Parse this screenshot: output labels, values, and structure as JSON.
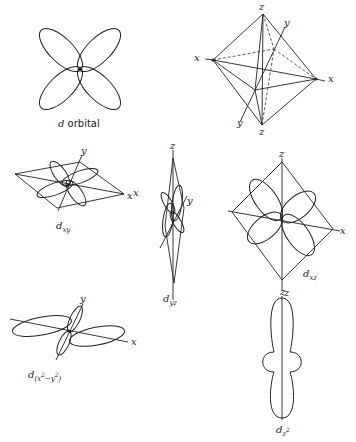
{
  "figure": {
    "panels": [
      {
        "id": "d-orbital",
        "caption_symbol": "d",
        "caption_text": " orbital"
      },
      {
        "id": "octahedron",
        "axis_labels": {
          "z_top": "z",
          "z_bottom": "z",
          "y_top": "y",
          "y_bottom": "y",
          "x_left": "x",
          "x_right": "x"
        }
      },
      {
        "id": "dxy",
        "caption_symbol": "d",
        "caption_sub": "xy",
        "axis_labels": {
          "y": "y",
          "x": "x"
        }
      },
      {
        "id": "dyz",
        "caption_symbol": "d",
        "caption_sub": "yz",
        "axis_labels": {
          "z": "z",
          "y": "y",
          "x": "x"
        }
      },
      {
        "id": "dxz",
        "caption_symbol": "d",
        "caption_sub": "xz",
        "axis_labels": {
          "z_top": "z",
          "z_bottom": "z",
          "x": "x"
        }
      },
      {
        "id": "dx2-y2",
        "caption_symbol": "d",
        "caption_sub": "(x",
        "caption_sup1": "2",
        "caption_mid": "−y",
        "caption_sup2": "2",
        "caption_end": ")",
        "axis_labels": {
          "y": "y",
          "x": "x"
        }
      },
      {
        "id": "dz2",
        "caption_symbol": "d",
        "caption_sub": "z",
        "caption_sup": "2",
        "axis_labels": {
          "z": "z"
        }
      }
    ]
  }
}
